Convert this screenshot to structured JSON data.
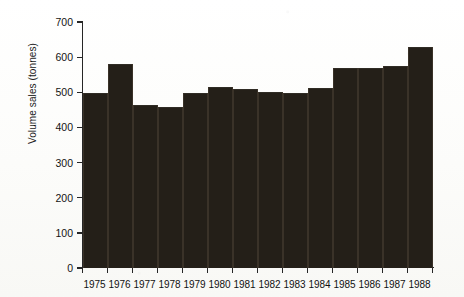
{
  "chart_data": {
    "type": "bar",
    "title": "",
    "xlabel": "",
    "ylabel": "Volume sales (tonnes)",
    "categories": [
      "1975",
      "1976",
      "1977",
      "1978",
      "1979",
      "1980",
      "1981",
      "1982",
      "1983",
      "1984",
      "1985",
      "1986",
      "1987",
      "1988"
    ],
    "values": [
      499,
      580,
      465,
      458,
      497,
      514,
      508,
      500,
      499,
      513,
      570,
      570,
      575,
      630
    ],
    "ylim": [
      0,
      700
    ],
    "ytick_labels": [
      "0",
      "100",
      "200",
      "300",
      "400",
      "500",
      "600",
      "700"
    ],
    "ytick_values": [
      0,
      100,
      200,
      300,
      400,
      500,
      600,
      700
    ],
    "grid": false,
    "legend": "none",
    "bar_color": "#241f18",
    "axis_color": "#262626",
    "background_color": "#fdfdfb"
  }
}
